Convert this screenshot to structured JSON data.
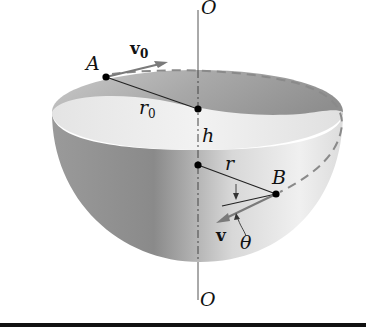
{
  "figure": {
    "type": "physics-diagram",
    "labels": {
      "axis_top": "O",
      "axis_bottom": "O",
      "point_a": "A",
      "point_b": "B",
      "initial_velocity": "v",
      "initial_velocity_sub": "0",
      "initial_radius": "r",
      "initial_radius_sub": "0",
      "height": "h",
      "radius": "r",
      "velocity": "v",
      "angle": "θ"
    },
    "colors": {
      "background": "#ffffff",
      "bowl_outer_dark": "#8c8c8c",
      "bowl_outer_light": "#e6e6e6",
      "bowl_inner": "#b5b5b5",
      "rim_face": "#ececec",
      "lines": "#222222",
      "vector": "#7a7a7a"
    }
  }
}
